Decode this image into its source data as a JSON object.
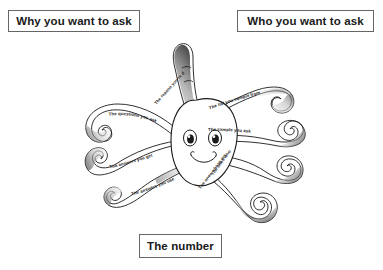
{
  "diagram": {
    "boxes": {
      "why": "Why you want to ask",
      "who": "Who you want to ask",
      "number": "The number"
    },
    "tentacle_labels": {
      "reason": "The reason you're doing it",
      "questions": "The questions you ask",
      "answers_get": "The answers you get",
      "answers_use": "The answers you use",
      "list": "The list you sample from",
      "sample": "The sample you ask",
      "responded": "The ones who responded",
      "responses_use": "The ones whose responses you use"
    },
    "colors": {
      "ink": "#1a1a1a",
      "box_border": "#666666",
      "background": "#ffffff",
      "shade_light": "#d9d9d9",
      "shade_dark": "#5a5a5a"
    }
  }
}
